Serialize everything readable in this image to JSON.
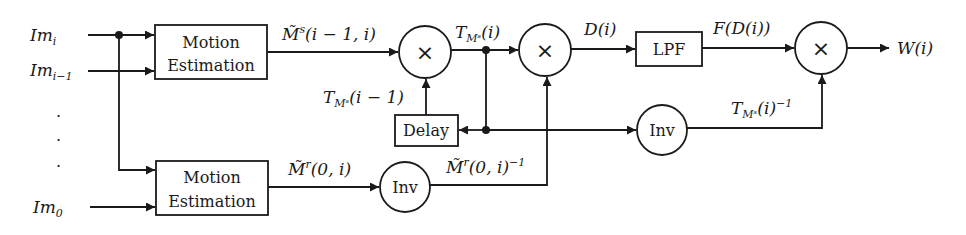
{
  "diagram": {
    "inputs": [
      {
        "id": "im_i",
        "label": "Im",
        "sub": "i"
      },
      {
        "id": "im_i_minus_1",
        "label": "Im",
        "sub": "i−1"
      },
      {
        "id": "im_0",
        "label": "Im",
        "sub": "0"
      }
    ],
    "ellipsis": [
      "·",
      "·",
      "·"
    ],
    "blocks": {
      "motion_estimation_1": {
        "line1": "Motion",
        "line2": "Estimation"
      },
      "motion_estimation_2": {
        "line1": "Motion",
        "line2": "Estimation"
      },
      "lpf": {
        "label": "LPF"
      },
      "delay": {
        "label": "Delay"
      },
      "inv_1": {
        "label": "Inv"
      },
      "inv_2": {
        "label": "Inv"
      },
      "multiply_1": {
        "symbol": "×"
      },
      "multiply_2": {
        "symbol": "×"
      },
      "multiply_3": {
        "symbol": "×"
      }
    },
    "signals": {
      "m_s": "M̃ˢ(i − 1, i)",
      "t_ms_i": "T_Mˢ(i)",
      "t_ms_prev": "T_Mˢ(i − 1)",
      "d_i": "D(i)",
      "f_d_i": "F(D(i))",
      "w_i": "W(i)",
      "m_r": "M̃ʳ(0, i)",
      "m_r_inv": "M̃ʳ(0, i)⁻¹",
      "t_ms_inv": "T_Mˢ(i)⁻¹"
    },
    "signal_parts": {
      "m_s": {
        "main": "M̃",
        "sup": "s",
        "args": "(i − 1, i)"
      },
      "t_ms_i": {
        "main": "T",
        "subs": "Mˢ",
        "args": "(i)"
      },
      "t_ms_prev": {
        "main": "T",
        "subs": "Mˢ",
        "args": "(i − 1)"
      },
      "d_i": {
        "text": "D(i)"
      },
      "f_d_i": {
        "text": "F(D(i))"
      },
      "w_i": {
        "text": "W(i)"
      },
      "m_r": {
        "main": "M̃",
        "sup": "r",
        "args": "(0, i)"
      },
      "m_r_inv": {
        "main": "M̃",
        "sup": "r",
        "args": "(0, i)",
        "exp": "−1"
      },
      "t_ms_inv": {
        "main": "T",
        "subs": "Mˢ",
        "args": "(i)",
        "exp": "−1"
      }
    }
  }
}
